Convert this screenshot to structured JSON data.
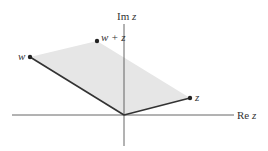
{
  "figure": {
    "axes": {
      "imaginary_label_prefix": "Im",
      "imaginary_label_var": "z",
      "real_label_prefix": "Re",
      "real_label_var": "z"
    },
    "points": [
      {
        "id": "w",
        "label": "w",
        "x": 30,
        "y": 57
      },
      {
        "id": "w_plus_z",
        "label": "w + z",
        "x": 97,
        "y": 41
      },
      {
        "id": "z",
        "label": "z",
        "x": 190,
        "y": 98
      }
    ],
    "origin": {
      "x": 124,
      "y": 115
    },
    "colors": {
      "fill": "#e6e6e6",
      "line": "#333333",
      "axis": "#555555",
      "point": "#222222"
    }
  }
}
